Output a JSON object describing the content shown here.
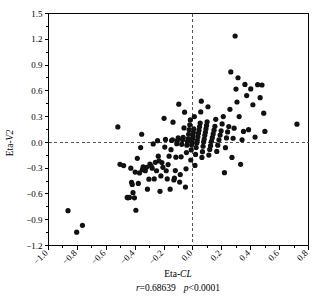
{
  "chart_data": {
    "type": "scatter",
    "title": "",
    "xlabel": "Eta-CL",
    "xlabel_plain": "Eta-",
    "xlabel_italic": "CL",
    "ylabel": "Eta-V2",
    "ylabel_plain": "Eta-",
    "ylabel_italic": "V2",
    "xlim": [
      -1.0,
      0.8
    ],
    "ylim": [
      -1.2,
      1.5
    ],
    "xticks": [
      "-1.0",
      "-0.8",
      "-0.6",
      "-0.4",
      "-0.2",
      "0.0",
      "0.2",
      "0.4",
      "0.6",
      "0.8"
    ],
    "xtick_values": [
      -1.0,
      -0.8,
      -0.6,
      -0.4,
      -0.2,
      0.0,
      0.2,
      0.4,
      0.6,
      0.8
    ],
    "yticks": [
      "1.5",
      "1.2",
      "0.9",
      "0.6",
      "0.3",
      "0.0",
      "-0.3",
      "-0.6",
      "-0.9",
      "-1.2"
    ],
    "ytick_values": [
      1.5,
      1.2,
      0.9,
      0.6,
      0.3,
      0.0,
      -0.3,
      -0.6,
      -0.9,
      -1.2
    ],
    "grid": false,
    "legend": "none",
    "reference_lines": {
      "horizontal_y": 0.0,
      "vertical_x": 0.0,
      "style": "dashed"
    },
    "marker": {
      "shape": "circle",
      "color": "#111111",
      "radius_px": 2.6
    },
    "annotations": {
      "correlation_r_label": "r",
      "correlation_r_value": "=0.68639",
      "pvalue_label": "p",
      "pvalue_value": "<0.0001",
      "full_caption": "r=0.68639  p<0.0001"
    },
    "n_points": 152,
    "points": [
      [
        -0.865,
        -0.795
      ],
      [
        -0.805,
        -1.045
      ],
      [
        -0.765,
        -0.965
      ],
      [
        -0.52,
        0.18
      ],
      [
        -0.505,
        -0.255
      ],
      [
        -0.48,
        -0.27
      ],
      [
        -0.455,
        -0.64
      ],
      [
        -0.45,
        -0.645
      ],
      [
        -0.44,
        -0.64
      ],
      [
        -0.43,
        -0.3
      ],
      [
        -0.425,
        -0.465
      ],
      [
        -0.42,
        -0.49
      ],
      [
        -0.415,
        -0.585
      ],
      [
        -0.405,
        -0.645
      ],
      [
        -0.4,
        -0.345
      ],
      [
        -0.395,
        -0.79
      ],
      [
        -0.385,
        -0.185
      ],
      [
        -0.378,
        -0.478
      ],
      [
        -0.37,
        -0.355
      ],
      [
        -0.362,
        -0.06
      ],
      [
        -0.355,
        0.095
      ],
      [
        -0.35,
        -0.318
      ],
      [
        -0.345,
        -0.285
      ],
      [
        -0.338,
        -0.3
      ],
      [
        -0.33,
        -0.33
      ],
      [
        -0.322,
        -0.29
      ],
      [
        -0.315,
        -0.545
      ],
      [
        -0.305,
        -0.428
      ],
      [
        -0.298,
        -0.252
      ],
      [
        -0.29,
        -0.272
      ],
      [
        -0.282,
        -0.3
      ],
      [
        -0.275,
        -0.018
      ],
      [
        -0.268,
        -0.425
      ],
      [
        -0.26,
        -0.232
      ],
      [
        -0.252,
        -0.33
      ],
      [
        -0.245,
        0.02
      ],
      [
        -0.24,
        -0.16
      ],
      [
        -0.235,
        -0.215
      ],
      [
        -0.228,
        -0.57
      ],
      [
        -0.222,
        -0.39
      ],
      [
        -0.215,
        -0.235
      ],
      [
        -0.208,
        -0.29
      ],
      [
        -0.2,
        0.28
      ],
      [
        -0.195,
        -0.055
      ],
      [
        -0.19,
        0.035
      ],
      [
        -0.185,
        -0.33
      ],
      [
        -0.178,
        -0.425
      ],
      [
        -0.172,
        -0.258
      ],
      [
        -0.165,
        -0.16
      ],
      [
        -0.158,
        -0.545
      ],
      [
        -0.152,
        -0.085
      ],
      [
        -0.148,
        0.022
      ],
      [
        -0.142,
        0.03
      ],
      [
        -0.138,
        0.235
      ],
      [
        -0.132,
        -0.438
      ],
      [
        -0.128,
        -0.415
      ],
      [
        -0.122,
        -0.328
      ],
      [
        -0.118,
        -0.172
      ],
      [
        -0.112,
        -0.015
      ],
      [
        -0.108,
        0.02
      ],
      [
        -0.102,
        0.052
      ],
      [
        -0.098,
        0.445
      ],
      [
        -0.092,
        -0.462
      ],
      [
        -0.088,
        -0.375
      ],
      [
        -0.082,
        -0.168
      ],
      [
        -0.078,
        -0.022
      ],
      [
        -0.072,
        0.032
      ],
      [
        -0.068,
        0.06
      ],
      [
        -0.062,
        0.168
      ],
      [
        -0.058,
        0.352
      ],
      [
        -0.052,
        -0.52
      ],
      [
        -0.048,
        -0.308
      ],
      [
        -0.045,
        -0.118
      ],
      [
        -0.042,
        -0.032
      ],
      [
        -0.038,
        0.01
      ],
      [
        -0.034,
        0.042
      ],
      [
        -0.03,
        0.095
      ],
      [
        -0.026,
        0.148
      ],
      [
        -0.022,
        0.205
      ],
      [
        -0.018,
        0.262
      ],
      [
        -0.015,
        -0.205
      ],
      [
        -0.012,
        -0.088
      ],
      [
        -0.009,
        -0.028
      ],
      [
        -0.006,
        0.008
      ],
      [
        -0.003,
        0.045
      ],
      [
        0.0,
        0.078
      ],
      [
        0.003,
        0.115
      ],
      [
        0.006,
        0.158
      ],
      [
        0.01,
        0.3
      ],
      [
        0.014,
        -0.268
      ],
      [
        0.018,
        -0.14
      ],
      [
        0.022,
        -0.06
      ],
      [
        0.026,
        -0.01
      ],
      [
        0.03,
        0.025
      ],
      [
        0.034,
        0.065
      ],
      [
        0.038,
        0.105
      ],
      [
        0.042,
        0.142
      ],
      [
        0.046,
        0.185
      ],
      [
        0.05,
        0.225
      ],
      [
        0.054,
        0.355
      ],
      [
        0.058,
        0.48
      ],
      [
        0.062,
        -0.175
      ],
      [
        0.066,
        -0.108
      ],
      [
        0.07,
        -0.045
      ],
      [
        0.074,
        0.005
      ],
      [
        0.078,
        0.038
      ],
      [
        0.082,
        0.082
      ],
      [
        0.086,
        0.118
      ],
      [
        0.09,
        0.158
      ],
      [
        0.094,
        0.198
      ],
      [
        0.098,
        0.24
      ],
      [
        0.104,
        0.415
      ],
      [
        0.11,
        -0.148
      ],
      [
        0.116,
        -0.082
      ],
      [
        0.122,
        -0.038
      ],
      [
        0.128,
        0.012
      ],
      [
        0.134,
        0.055
      ],
      [
        0.14,
        0.098
      ],
      [
        0.146,
        0.142
      ],
      [
        0.152,
        0.188
      ],
      [
        0.158,
        0.268
      ],
      [
        0.165,
        -0.105
      ],
      [
        0.172,
        -0.032
      ],
      [
        0.18,
        0.03
      ],
      [
        0.188,
        0.085
      ],
      [
        0.195,
        0.135
      ],
      [
        0.202,
        0.215
      ],
      [
        0.21,
        0.3
      ],
      [
        0.218,
        -0.352
      ],
      [
        0.225,
        -0.062
      ],
      [
        0.232,
        0.052
      ],
      [
        0.24,
        0.122
      ],
      [
        0.248,
        0.185
      ],
      [
        0.256,
        0.385
      ],
      [
        0.262,
        0.82
      ],
      [
        0.27,
        -0.175
      ],
      [
        0.278,
        0.048
      ],
      [
        0.285,
        0.165
      ],
      [
        0.292,
        1.238
      ],
      [
        0.298,
        0.62
      ],
      [
        0.305,
        0.47
      ],
      [
        0.312,
        0.752
      ],
      [
        0.32,
        0.3
      ],
      [
        0.33,
        -0.255
      ],
      [
        0.34,
        0.03
      ],
      [
        0.35,
        0.128
      ],
      [
        0.36,
        0.675
      ],
      [
        0.372,
        0.545
      ],
      [
        0.385,
        0.148
      ],
      [
        0.4,
        0.622
      ],
      [
        0.415,
        0.438
      ],
      [
        0.43,
        0.062
      ],
      [
        0.448,
        0.672
      ],
      [
        0.465,
        0.52
      ],
      [
        0.478,
        0.668
      ],
      [
        0.49,
        0.34
      ],
      [
        0.498,
        0.128
      ],
      [
        0.72,
        0.212
      ]
    ]
  }
}
